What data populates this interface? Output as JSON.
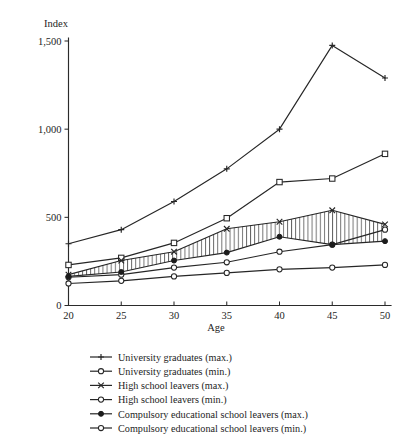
{
  "chart_data": {
    "type": "line",
    "title": "",
    "xlabel": "Age",
    "ylabel": "Index",
    "x": [
      20,
      25,
      30,
      35,
      40,
      45,
      50
    ],
    "xtick_labels": [
      "20",
      "25",
      "30",
      "35",
      "40",
      "45",
      "50"
    ],
    "ytick_labels": [
      "0",
      "500",
      "1,000",
      "1,500"
    ],
    "ytick_values": [
      0,
      500,
      1000,
      1500
    ],
    "xlim": [
      20,
      50
    ],
    "ylim": [
      0,
      1550
    ],
    "grid": false,
    "legend_position": "below",
    "shaded_band": {
      "upper_series": "High school leavers (max.)",
      "lower_series": "Compulsory educational school leavers (max.)",
      "pattern": "vertical-hatch"
    },
    "series": [
      {
        "name": "University graduates (max.)",
        "marker": "plus",
        "values": [
          350,
          430,
          590,
          775,
          1000,
          1475,
          1290
        ]
      },
      {
        "name": "University graduates (min.)",
        "marker": "open-square",
        "values": [
          230,
          270,
          355,
          495,
          700,
          720,
          860
        ]
      },
      {
        "name": "High school leavers (max.)",
        "marker": "cross",
        "values": [
          175,
          255,
          305,
          435,
          475,
          540,
          460
        ]
      },
      {
        "name": "High school leavers (min.)",
        "marker": "open-circle",
        "values": [
          160,
          175,
          215,
          245,
          305,
          345,
          430
        ]
      },
      {
        "name": "Compulsory educational school leavers (max.)",
        "marker": "filled-circle",
        "values": [
          165,
          190,
          255,
          300,
          390,
          345,
          365
        ]
      },
      {
        "name": "Compulsory educational school leavers (min.)",
        "marker": "open-circle",
        "values": [
          125,
          140,
          165,
          185,
          205,
          215,
          230
        ]
      }
    ]
  },
  "legend": {
    "items": [
      {
        "label": "University graduates (max.)",
        "marker": "plus"
      },
      {
        "label": "University graduates (min.)",
        "marker": "open-circle"
      },
      {
        "label": "High school leavers (max.)",
        "marker": "cross"
      },
      {
        "label": "High school leavers (min.)",
        "marker": "open-circle"
      },
      {
        "label": "Compulsory educational school leavers (max.)",
        "marker": "filled-circle"
      },
      {
        "label": "Compulsory educational school leavers (min.)",
        "marker": "open-circle"
      }
    ]
  },
  "colors": {
    "ink": "#262626",
    "background": "#ffffff"
  }
}
